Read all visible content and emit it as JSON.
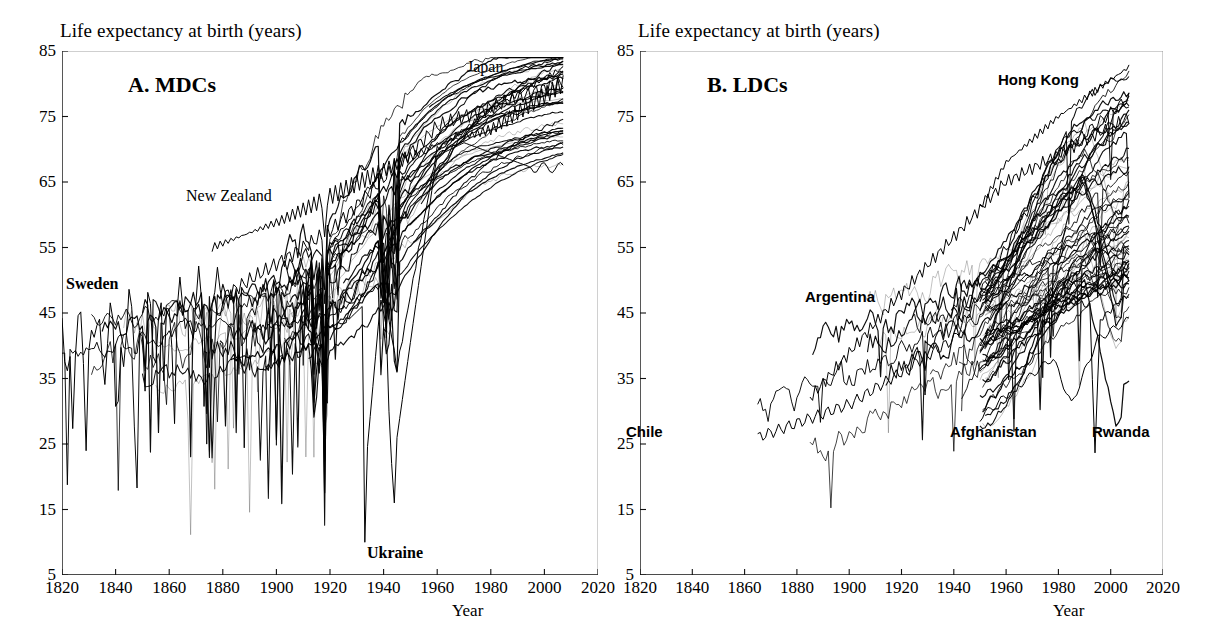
{
  "figure": {
    "background_color": "#ffffff",
    "line_color": "#000000"
  },
  "panels": [
    {
      "id": "A",
      "title": "A. MDCs",
      "y_axis_title": "Life expectancy at birth (years)",
      "x_axis_title": "Year",
      "annotations": [
        {
          "text": "Sweden",
          "style": "serif-bold"
        },
        {
          "text": "New Zealand",
          "style": "serif"
        },
        {
          "text": "Japan",
          "style": "serif"
        },
        {
          "text": "Ukraine",
          "style": "serif-bold"
        }
      ]
    },
    {
      "id": "B",
      "title": "B. LDCs",
      "y_axis_title": "Life expectancy at birth (years)",
      "x_axis_title": "Year",
      "annotations": [
        {
          "text": "Hong Kong",
          "style": "sans-bold"
        },
        {
          "text": "Argentina",
          "style": "sans-bold"
        },
        {
          "text": "Chile",
          "style": "sans-bold"
        },
        {
          "text": "Afghanistan",
          "style": "sans-bold"
        },
        {
          "text": "Rwanda",
          "style": "sans-bold"
        }
      ]
    }
  ],
  "chart_data": [
    {
      "type": "line",
      "panel": "A",
      "title": "A. MDCs",
      "xlabel": "Year",
      "ylabel": "Life expectancy at birth (years)",
      "xlim": [
        1820,
        2020
      ],
      "ylim": [
        5,
        85
      ],
      "xticks": [
        1820,
        1840,
        1860,
        1880,
        1900,
        1920,
        1940,
        1960,
        1980,
        2000,
        2020
      ],
      "yticks": [
        5,
        15,
        25,
        35,
        45,
        55,
        65,
        75,
        85
      ],
      "grid": false,
      "legend": "none",
      "description": "Life expectancy trajectories for more developed countries (MDCs), 1820-2007. Roughly 40 overlapping national series rising from about 35-40 years in 1820 to 78-82 years by 2007, with deep downward spikes for epidemic and war years.",
      "series": [
        {
          "name": "Sweden",
          "x": [
            1820,
            1840,
            1860,
            1880,
            1900,
            1920,
            1940,
            1960,
            1980,
            2000,
            2007
          ],
          "values": [
            39,
            43,
            44,
            48,
            54,
            58,
            66,
            73,
            76,
            80,
            81
          ]
        },
        {
          "name": "New Zealand",
          "x": [
            1876,
            1890,
            1900,
            1920,
            1940,
            1960,
            1980,
            2000,
            2007
          ],
          "values": [
            55,
            57,
            59,
            62,
            67,
            71,
            73,
            78,
            80
          ]
        },
        {
          "name": "Japan",
          "x": [
            1891,
            1910,
            1930,
            1947,
            1960,
            1980,
            2000,
            2007
          ],
          "values": [
            43,
            44,
            46,
            52,
            68,
            76,
            81,
            82.5
          ]
        },
        {
          "name": "Ukraine",
          "x": [
            1927,
            1933,
            1938,
            1941,
            1946,
            1960,
            1980,
            2000,
            2007
          ],
          "values": [
            45,
            10,
            45,
            38,
            16,
            70,
            70,
            68,
            68
          ]
        }
      ],
      "annotated_points": [
        {
          "label": "Sweden",
          "note": "earliest continuous series, begins 1820 near 39 years"
        },
        {
          "label": "New Zealand",
          "note": "highest MDC values in late 19th century, near 60 years"
        },
        {
          "label": "Japan",
          "note": "highest MDC values after 1980, reaching about 82 years"
        },
        {
          "label": "Ukraine",
          "note": "catastrophic dips to about 10 years (1933 famine) and 16 years (1940s war)"
        }
      ]
    },
    {
      "type": "line",
      "panel": "B",
      "title": "B. LDCs",
      "xlabel": "Year",
      "ylabel": "Life expectancy at birth (years)",
      "xlim": [
        1820,
        2020
      ],
      "ylim": [
        5,
        85
      ],
      "xticks": [
        1820,
        1840,
        1860,
        1880,
        1900,
        1920,
        1940,
        1960,
        1980,
        2000,
        2020
      ],
      "yticks": [
        5,
        15,
        25,
        35,
        45,
        55,
        65,
        75,
        85
      ],
      "grid": false,
      "legend": "none",
      "description": "Life expectancy trajectories for less developed countries (LDCs). Few series before 1900; most begin around 1950 near 30-45 years and rise steeply to 45-80 years by 2007, with sharp collapses for Afghanistan, Rwanda and HIV-affected countries.",
      "series": [
        {
          "name": "Chile",
          "x": [
            1865,
            1885,
            1900,
            1920,
            1940,
            1960,
            1980,
            2000,
            2007
          ],
          "values": [
            26,
            29,
            31,
            33,
            41,
            57,
            69,
            76,
            78
          ]
        },
        {
          "name": "Argentina",
          "x": [
            1885,
            1900,
            1920,
            1940,
            1960,
            1980,
            2000,
            2007
          ],
          "values": [
            32,
            39,
            48,
            58,
            65,
            69,
            74,
            75
          ]
        },
        {
          "name": "Hong Kong",
          "x": [
            1950,
            1960,
            1970,
            1980,
            1990,
            2000,
            2007
          ],
          "values": [
            61,
            68,
            72,
            75,
            78,
            81,
            82.5
          ]
        },
        {
          "name": "Afghanistan",
          "x": [
            1950,
            1960,
            1970,
            1978,
            1985,
            1995,
            2000,
            2007
          ],
          "values": [
            29,
            33,
            36,
            38,
            31,
            41,
            43,
            44
          ]
        },
        {
          "name": "Rwanda",
          "x": [
            1950,
            1970,
            1985,
            1992,
            1994,
            2000,
            2007
          ],
          "values": [
            40,
            44,
            47,
            46,
            24,
            44,
            48
          ]
        }
      ],
      "annotated_points": [
        {
          "label": "Chile",
          "note": "earliest LDC series, begins about 1865 near 26 years"
        },
        {
          "label": "Argentina",
          "note": "early LDC series starting about 1885 near 32 years"
        },
        {
          "label": "Hong Kong",
          "note": "highest LDC values, reaching about 82 years by 2007"
        },
        {
          "label": "Afghanistan",
          "note": "persistently low, dipping in the 1980s"
        },
        {
          "label": "Rwanda",
          "note": "collapse to about 24 years during the 1994 genocide"
        }
      ]
    }
  ]
}
